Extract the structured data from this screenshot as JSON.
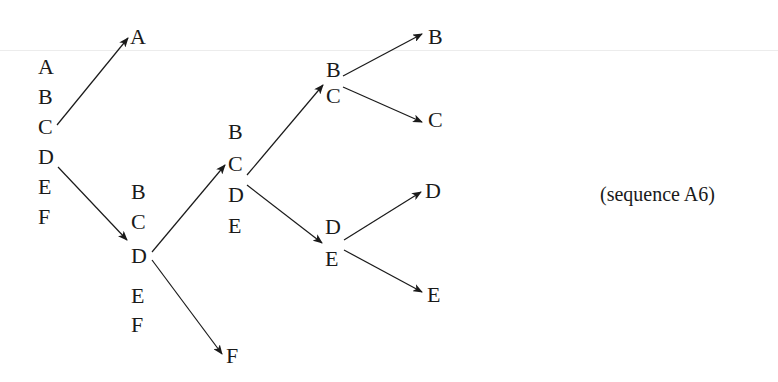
{
  "diagram": {
    "caption": "(sequence A6)",
    "columns": [
      {
        "id": "col1",
        "letters": [
          "A",
          "B",
          "C",
          "D",
          "E",
          "F"
        ]
      },
      {
        "id": "col2",
        "letters": [
          "B",
          "C",
          "D",
          "E",
          "F"
        ]
      },
      {
        "id": "col3",
        "letters": [
          "B",
          "C",
          "D",
          "E"
        ]
      },
      {
        "id": "col4-top",
        "letters": [
          "B",
          "C"
        ]
      },
      {
        "id": "col4-bottom",
        "letters": [
          "D",
          "E"
        ]
      }
    ],
    "leaves": {
      "a_top": "A",
      "f_bottom": "F",
      "b_right": "B",
      "c_right": "C",
      "d_right": "D",
      "e_right": "E"
    },
    "arrows": [
      {
        "from": "col1.C",
        "to": "A"
      },
      {
        "from": "col1.D",
        "to": "col2"
      },
      {
        "from": "col2.D",
        "to": "col3"
      },
      {
        "from": "col2.D",
        "to": "F"
      },
      {
        "from": "col3.C",
        "to": "col4-top"
      },
      {
        "from": "col3.D",
        "to": "col4-bottom"
      },
      {
        "from": "col4-top.B",
        "to": "B"
      },
      {
        "from": "col4-top.C",
        "to": "C"
      },
      {
        "from": "col4-bottom.D",
        "to": "D"
      },
      {
        "from": "col4-bottom.E",
        "to": "E"
      }
    ]
  }
}
